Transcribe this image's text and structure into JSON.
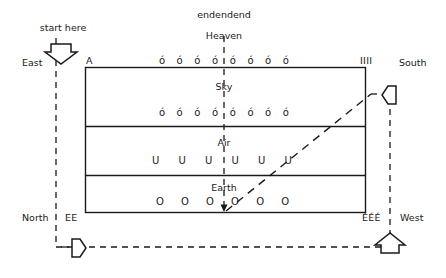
{
  "diagram": {
    "title_top": "endendend",
    "heaven_label": "Heaven",
    "start_label": "start here",
    "compass": {
      "east": "East",
      "south": "South",
      "north": "North",
      "west": "West"
    },
    "corner_marks": {
      "top_left": "A",
      "top_right": "IIII",
      "bottom_left": "EE",
      "bottom_right": "ÉÉÉ"
    },
    "bands": [
      {
        "name": "heaven-band",
        "label": "",
        "glyphs": "ó ó ó ó ó ó ó ó",
        "glyph_count": 8,
        "glyph_char": "ó"
      },
      {
        "name": "sky-band",
        "label": "Sky",
        "glyphs": "ó ó ó ó ó ó ó ó",
        "glyph_count": 8,
        "glyph_char": "ó"
      },
      {
        "name": "air-band",
        "label": "Air",
        "glyphs": "U U U U U U",
        "glyph_count": 6,
        "glyph_char": "U"
      },
      {
        "name": "earth-band",
        "label": "Earth",
        "glyphs": "O O O O O O",
        "glyph_count": 6,
        "glyph_char": "O"
      }
    ],
    "arrows": {
      "start_arrow": "arrow-down",
      "right_arrow": "arrow-left",
      "bottom_left_arrow": "arrow-right",
      "bottom_right_arrow": "arrow-up"
    },
    "colors": {
      "stroke": "#1a1a1a",
      "background": "#ffffff",
      "text": "#1a1a1a"
    }
  }
}
